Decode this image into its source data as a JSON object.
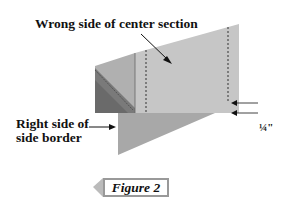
{
  "diagram": {
    "labels": {
      "center_section": "Wrong side of center section",
      "side_border_line1": "Right side of",
      "side_border_line2": "side border",
      "seam_allowance": "¼\""
    },
    "figure_tag": "Figure 2",
    "colors": {
      "center_section_fill": "#c6c6c6",
      "side_top_fill": "#b0b0b0",
      "side_dark_fill": "#7a7a7a",
      "border_triangle_fill": "#a8a8a8",
      "figure_tag_border": "#999999",
      "text": "#111111"
    }
  }
}
